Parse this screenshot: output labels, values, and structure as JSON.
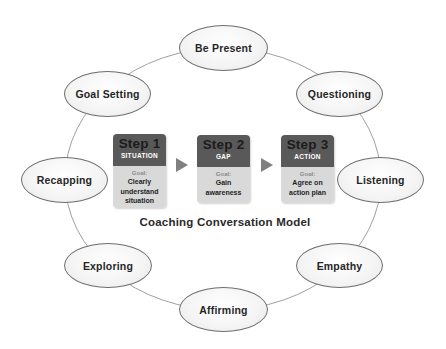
{
  "diagram": {
    "title": "Coaching Conversation Model",
    "ring_nodes": [
      {
        "label": "Be Present",
        "cx": 223,
        "cy": 48
      },
      {
        "label": "Questioning",
        "cx": 339,
        "cy": 94
      },
      {
        "label": "Listening",
        "cx": 380,
        "cy": 180
      },
      {
        "label": "Empathy",
        "cx": 339,
        "cy": 265
      },
      {
        "label": "Affirming",
        "cx": 223,
        "cy": 309
      },
      {
        "label": "Exploring",
        "cx": 108,
        "cy": 265
      },
      {
        "label": "Recapping",
        "cx": 65,
        "cy": 180
      },
      {
        "label": "Goal Setting",
        "cx": 107,
        "cy": 94
      }
    ],
    "steps": [
      {
        "title": "Step 1",
        "subtitle": "SITUATION",
        "goal_label": "Goal:",
        "goal_lines": [
          "Clearly",
          "understand",
          "situation"
        ]
      },
      {
        "title": "Step 2",
        "subtitle": "GAP",
        "goal_label": "Goal:",
        "goal_lines": [
          "Gain",
          "awareness"
        ]
      },
      {
        "title": "Step 3",
        "subtitle": "ACTION",
        "goal_label": "Goal:",
        "goal_lines": [
          "Agree on",
          "action plan"
        ]
      }
    ],
    "colors": {
      "step_header": "#595959",
      "step_body": "#d9d9d9",
      "arrow": "#808080",
      "ring_line": "#9a9a9a",
      "node_border": "#6e6e6e"
    }
  }
}
